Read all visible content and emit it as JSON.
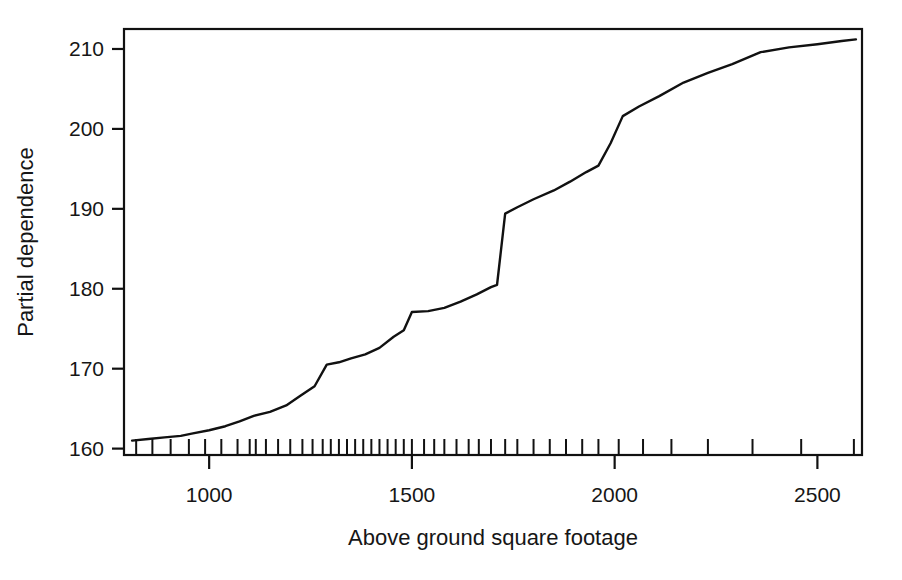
{
  "chart_data": {
    "type": "line",
    "title": "",
    "subtitle": "",
    "xlabel": "Above ground square footage",
    "ylabel": "Partial dependence",
    "xlim": [
      790,
      2610
    ],
    "ylim": [
      159.2,
      212.5
    ],
    "grid": false,
    "legend": null,
    "annotations": [],
    "x_ticks": [
      1000,
      1500,
      2000,
      2500
    ],
    "x_tick_labels": [
      "1000",
      "1500",
      "2000",
      "2500"
    ],
    "y_ticks": [
      160,
      170,
      180,
      190,
      200,
      210
    ],
    "y_tick_labels": [
      "160",
      "170",
      "180",
      "190",
      "200",
      "210"
    ],
    "line_color": "#111111",
    "line_width": 2.4,
    "series": [
      {
        "name": "Partial dependence",
        "x": [
          810,
          850,
          890,
          930,
          960,
          1000,
          1040,
          1075,
          1110,
          1150,
          1190,
          1225,
          1260,
          1290,
          1320,
          1350,
          1385,
          1420,
          1455,
          1480,
          1500,
          1540,
          1580,
          1620,
          1660,
          1695,
          1710,
          1730,
          1760,
          1800,
          1850,
          1890,
          1930,
          1960,
          1990,
          2020,
          2060,
          2110,
          2170,
          2230,
          2290,
          2360,
          2430,
          2500,
          2560,
          2595
        ],
        "y": [
          161.0,
          161.2,
          161.4,
          161.6,
          161.9,
          162.3,
          162.8,
          163.4,
          164.1,
          164.6,
          165.4,
          166.6,
          167.8,
          170.5,
          170.8,
          171.3,
          171.8,
          172.6,
          174.0,
          174.8,
          177.1,
          177.2,
          177.6,
          178.4,
          179.3,
          180.2,
          180.5,
          189.4,
          190.2,
          191.2,
          192.3,
          193.4,
          194.6,
          195.4,
          198.2,
          201.6,
          202.8,
          204.1,
          205.8,
          207.0,
          208.1,
          209.6,
          210.2,
          210.6,
          211.0,
          211.2
        ]
      }
    ],
    "rug": {
      "description": "rug marks of observed x values along bottom axis",
      "values": [
        820,
        860,
        905,
        950,
        990,
        1030,
        1070,
        1100,
        1115,
        1140,
        1170,
        1200,
        1230,
        1255,
        1280,
        1300,
        1320,
        1340,
        1360,
        1380,
        1400,
        1420,
        1440,
        1460,
        1480,
        1500,
        1530,
        1555,
        1580,
        1610,
        1640,
        1665,
        1695,
        1730,
        1760,
        1800,
        1840,
        1880,
        1920,
        1960,
        2010,
        2070,
        2140,
        2230,
        2340,
        2460,
        2590
      ]
    }
  },
  "axes": {
    "frame_color": "#111111",
    "background": "#ffffff"
  }
}
